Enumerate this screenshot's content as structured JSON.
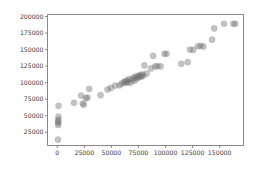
{
  "chart_data": {
    "type": "scatter",
    "title": "",
    "xlabel": "",
    "ylabel": "",
    "xlim": [
      -9000,
      172000
    ],
    "ylim": [
      5000,
      203000
    ],
    "grid": false,
    "legend": null,
    "marker": {
      "shape": "circle",
      "color": "#6f6f6f",
      "opacity": 0.42,
      "size_px": 6.2
    },
    "xticks": [
      0,
      25000,
      50000,
      75000,
      100000,
      125000,
      150000
    ],
    "xticklabels": [
      "0",
      "25000",
      "50000",
      "75000",
      "100000",
      "125000",
      "150000"
    ],
    "yticks": [
      25000,
      50000,
      75000,
      100000,
      125000,
      150000,
      175000,
      200000
    ],
    "yticklabels": [
      "25000",
      "50000",
      "75000",
      "100000",
      "125000",
      "150000",
      "175000",
      "200000"
    ],
    "points": [
      [
        700,
        14000
      ],
      [
        900,
        36000
      ],
      [
        800,
        39000
      ],
      [
        1000,
        41500
      ],
      [
        900,
        44000
      ],
      [
        1100,
        48500
      ],
      [
        1200,
        65000
      ],
      [
        15500,
        69500
      ],
      [
        22000,
        80500
      ],
      [
        23500,
        68500
      ],
      [
        24500,
        66500
      ],
      [
        26500,
        76500
      ],
      [
        28000,
        77500
      ],
      [
        29500,
        90500
      ],
      [
        40000,
        81000
      ],
      [
        46500,
        89500
      ],
      [
        49500,
        92000
      ],
      [
        53500,
        95500
      ],
      [
        57500,
        96000
      ],
      [
        59500,
        98500
      ],
      [
        61500,
        100500
      ],
      [
        62500,
        102000
      ],
      [
        63500,
        99500
      ],
      [
        64500,
        103500
      ],
      [
        65500,
        101000
      ],
      [
        66500,
        105500
      ],
      [
        67500,
        100000
      ],
      [
        69500,
        104500
      ],
      [
        70500,
        107500
      ],
      [
        71500,
        103000
      ],
      [
        72500,
        109500
      ],
      [
        73500,
        106500
      ],
      [
        74500,
        110000
      ],
      [
        75500,
        108000
      ],
      [
        76500,
        111500
      ],
      [
        77500,
        109000
      ],
      [
        78500,
        112500
      ],
      [
        79500,
        110500
      ],
      [
        80500,
        126000
      ],
      [
        82500,
        113500
      ],
      [
        86500,
        121500
      ],
      [
        88500,
        140500
      ],
      [
        90500,
        124500
      ],
      [
        92500,
        125000
      ],
      [
        95500,
        124500
      ],
      [
        99000,
        143500
      ],
      [
        101000,
        143500
      ],
      [
        114500,
        128500
      ],
      [
        120500,
        131000
      ],
      [
        122500,
        150000
      ],
      [
        125500,
        149500
      ],
      [
        130000,
        155000
      ],
      [
        132500,
        155500
      ],
      [
        135000,
        154500
      ],
      [
        143000,
        165000
      ],
      [
        145000,
        182000
      ],
      [
        154000,
        189000
      ],
      [
        162500,
        189000
      ],
      [
        164500,
        189000
      ]
    ]
  },
  "figure": {
    "background": "#ffffff",
    "axes_color": "#7a7a7a",
    "tick_color": "#3a3a3a"
  }
}
